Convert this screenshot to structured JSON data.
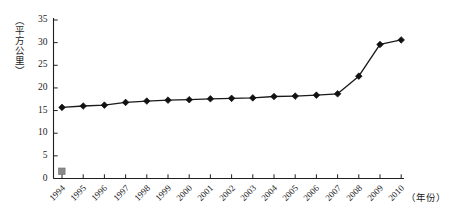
{
  "chart_data": {
    "type": "line",
    "title": "",
    "subtitle": "",
    "xlabel": "（年份）",
    "ylabel": "（平方公里）",
    "categories": [
      "1994",
      "1995",
      "1996",
      "1997",
      "1998",
      "1999",
      "2000",
      "2001",
      "2002",
      "2003",
      "2004",
      "2005",
      "2006",
      "2007",
      "2008",
      "2009",
      "2010"
    ],
    "values": [
      15.7,
      16.0,
      16.2,
      16.8,
      17.1,
      17.3,
      17.4,
      17.6,
      17.7,
      17.8,
      18.1,
      18.2,
      18.4,
      18.7,
      22.6,
      29.6,
      30.6
    ],
    "ylim": [
      0,
      35
    ],
    "yticks": [
      0,
      5,
      10,
      15,
      20,
      25,
      30,
      35
    ],
    "grid": false,
    "legend": {
      "position": "bottom-left-origin",
      "marker": "square",
      "label": ""
    },
    "marker": "diamond",
    "line_color": "#1a1a1a",
    "marker_color": "#111111"
  },
  "axis": {
    "y_tick_labels": [
      "35",
      "30",
      "25",
      "20",
      "15",
      "10",
      "5",
      "0"
    ],
    "x_tick_labels": [
      "1994",
      "1995",
      "1996",
      "1997",
      "1998",
      "1999",
      "2000",
      "2001",
      "2002",
      "2003",
      "2004",
      "2005",
      "2006",
      "2007",
      "2008",
      "2009",
      "2010"
    ],
    "y_unit_label": "（平方公里）",
    "x_unit_label": "（年份）"
  },
  "colors": {
    "axis": "#1f1f1f",
    "series": "#1a1a1a",
    "legend_marker": "#8a8a8a",
    "background": "#ffffff"
  }
}
